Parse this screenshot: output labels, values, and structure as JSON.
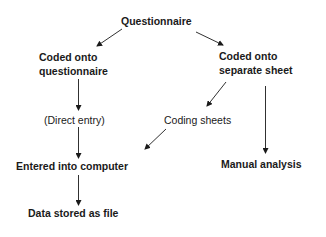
{
  "diagram": {
    "nodes": [
      {
        "id": "questionnaire",
        "lines": [
          "Questionnaire"
        ],
        "bold": true
      },
      {
        "id": "coded-onto-questionnaire",
        "lines": [
          "Coded onto",
          "questionnaire"
        ],
        "bold": true
      },
      {
        "id": "coded-onto-separate-sheet",
        "lines": [
          "Coded onto",
          "separate sheet"
        ],
        "bold": true
      },
      {
        "id": "direct-entry",
        "lines": [
          "(Direct entry)"
        ],
        "bold": false
      },
      {
        "id": "coding-sheets",
        "lines": [
          "Coding sheets"
        ],
        "bold": false
      },
      {
        "id": "entered-into-computer",
        "lines": [
          "Entered into computer"
        ],
        "bold": true
      },
      {
        "id": "manual-analysis",
        "lines": [
          "Manual analysis"
        ],
        "bold": true
      },
      {
        "id": "data-stored-as-file",
        "lines": [
          "Data stored as file"
        ],
        "bold": true
      }
    ],
    "edges": [
      {
        "from": "questionnaire",
        "to": "coded-onto-questionnaire"
      },
      {
        "from": "questionnaire",
        "to": "coded-onto-separate-sheet"
      },
      {
        "from": "coded-onto-questionnaire",
        "to": "direct-entry"
      },
      {
        "from": "coded-onto-separate-sheet",
        "to": "coding-sheets"
      },
      {
        "from": "coded-onto-separate-sheet",
        "to": "manual-analysis"
      },
      {
        "from": "direct-entry",
        "to": "entered-into-computer"
      },
      {
        "from": "coding-sheets",
        "to": "entered-into-computer"
      },
      {
        "from": "entered-into-computer",
        "to": "data-stored-as-file"
      }
    ],
    "colors": {
      "line": "#1a1a1a",
      "text": "#1a1a1a",
      "background": "#ffffff"
    }
  }
}
